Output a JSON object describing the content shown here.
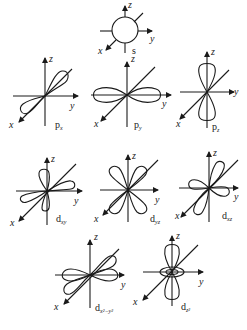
{
  "figure": {
    "axis_labels": {
      "x": "x",
      "y": "y",
      "z": "z"
    },
    "colors": {
      "line": "#1a1a1a",
      "background": "#ffffff"
    },
    "orbitals": [
      {
        "id": "s",
        "label_main": "s",
        "label_sub": ""
      },
      {
        "id": "px",
        "label_main": "p",
        "label_sub": "x"
      },
      {
        "id": "py",
        "label_main": "p",
        "label_sub": "y"
      },
      {
        "id": "pz",
        "label_main": "p",
        "label_sub": "z"
      },
      {
        "id": "dxy",
        "label_main": "d",
        "label_sub": "xy"
      },
      {
        "id": "dyz",
        "label_main": "d",
        "label_sub": "yz"
      },
      {
        "id": "dxz",
        "label_main": "d",
        "label_sub": "xz"
      },
      {
        "id": "dx2y2",
        "label_main": "d",
        "label_sub": "x²−y²"
      },
      {
        "id": "dz2",
        "label_main": "d",
        "label_sub": "z²"
      }
    ]
  }
}
